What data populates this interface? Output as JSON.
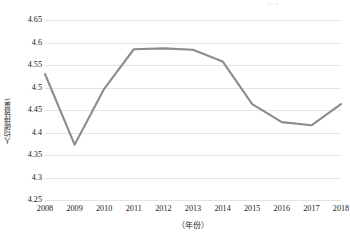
{
  "chart_data": {
    "type": "line",
    "title": "",
    "xlabel": "（年份）",
    "ylabel": "人均碳排放量/t",
    "categories": [
      "2008",
      "2009",
      "2010",
      "2011",
      "2012",
      "2013",
      "2014",
      "2015",
      "2016",
      "2017",
      "2018"
    ],
    "values": [
      4.53,
      4.373,
      4.497,
      4.585,
      4.587,
      4.584,
      4.558,
      4.463,
      4.423,
      4.416,
      4.463
    ],
    "series": [
      {
        "name": "人均碳排放量",
        "values": [
          4.53,
          4.373,
          4.497,
          4.585,
          4.587,
          4.584,
          4.558,
          4.463,
          4.423,
          4.416,
          4.463
        ]
      }
    ],
    "ylim": [
      4.25,
      4.65
    ],
    "yticks": [
      "4.25",
      "4.3",
      "4.35",
      "4.4",
      "4.45",
      "4.5",
      "4.55",
      "4.6",
      "4.65"
    ],
    "ytick_values": [
      4.25,
      4.3,
      4.35,
      4.4,
      4.45,
      4.5,
      4.55,
      4.6,
      4.65
    ],
    "xlim": [
      "2008",
      "2018"
    ],
    "grid": "horizontal",
    "legend": "none",
    "line_color": "#8c8c8c",
    "gridline_color": "#e4e4e4",
    "background_color": "#ffffff"
  }
}
